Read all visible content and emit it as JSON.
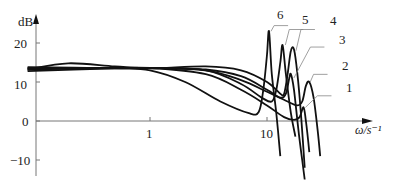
{
  "chart_data": {
    "type": "line",
    "title": "",
    "xlabel": "ω/s⁻¹",
    "ylabel": "dB",
    "xscale": "log",
    "xlim": [
      0.09,
      50
    ],
    "ylim": [
      -14,
      26
    ],
    "x_ticks": [
      {
        "value": 1,
        "label": "1"
      },
      {
        "value": 10,
        "label": "10"
      }
    ],
    "y_ticks": [
      {
        "value": 20,
        "label": "20"
      },
      {
        "value": 10,
        "label": "10"
      },
      {
        "value": 0,
        "label": "0"
      },
      {
        "value": -10,
        "label": "−10"
      }
    ],
    "grid": false,
    "legend": "curve numbers annotated with leader lines",
    "series": [
      {
        "name": "1",
        "points": [
          [
            0.09,
            12.8
          ],
          [
            0.5,
            13.5
          ],
          [
            1,
            13.6
          ],
          [
            3,
            12
          ],
          [
            6,
            8
          ],
          [
            10,
            4
          ],
          [
            14,
            1
          ],
          [
            17,
            0.3
          ],
          [
            19,
            1
          ],
          [
            20.5,
            3.5
          ],
          [
            21.5,
            0
          ],
          [
            23,
            -8
          ]
        ]
      },
      {
        "name": "2",
        "points": [
          [
            0.09,
            13.2
          ],
          [
            0.5,
            13.6
          ],
          [
            1,
            13.6
          ],
          [
            3,
            13
          ],
          [
            6,
            10.5
          ],
          [
            10,
            7.5
          ],
          [
            15,
            5
          ],
          [
            18,
            4
          ],
          [
            20,
            5
          ],
          [
            21.5,
            9
          ],
          [
            23,
            10
          ],
          [
            25,
            6
          ],
          [
            27,
            -2
          ],
          [
            28.5,
            -9
          ]
        ]
      },
      {
        "name": "3",
        "points": [
          [
            0.09,
            13.4
          ],
          [
            0.5,
            13.6
          ],
          [
            1,
            13.6
          ],
          [
            3,
            13.2
          ],
          [
            6,
            11.5
          ],
          [
            10,
            8
          ],
          [
            13,
            6
          ],
          [
            14.5,
            7
          ],
          [
            15.5,
            11
          ],
          [
            16,
            12
          ],
          [
            17,
            8
          ],
          [
            18.5,
            -2
          ],
          [
            20,
            -10
          ],
          [
            21,
            -15
          ]
        ]
      },
      {
        "name": "4",
        "points": [
          [
            0.09,
            13.2
          ],
          [
            0.2,
            14.8
          ],
          [
            0.5,
            14
          ],
          [
            1,
            13.5
          ],
          [
            3,
            14
          ],
          [
            6,
            13
          ],
          [
            10,
            10
          ],
          [
            13,
            7
          ],
          [
            14,
            7
          ],
          [
            15,
            12
          ],
          [
            16,
            18
          ],
          [
            17,
            18.3
          ],
          [
            18.2,
            12
          ],
          [
            19.5,
            2
          ],
          [
            21,
            -12
          ]
        ]
      },
      {
        "name": "5",
        "points": [
          [
            0.09,
            13.6
          ],
          [
            0.5,
            13.6
          ],
          [
            1,
            13.6
          ],
          [
            3,
            13
          ],
          [
            6,
            9.5
          ],
          [
            9,
            6
          ],
          [
            11,
            5
          ],
          [
            12,
            8
          ],
          [
            13,
            15
          ],
          [
            13.6,
            19.5
          ],
          [
            14.5,
            12
          ],
          [
            16,
            2
          ],
          [
            17.5,
            -4
          ]
        ]
      },
      {
        "name": "6",
        "points": [
          [
            0.09,
            13.8
          ],
          [
            0.5,
            13.5
          ],
          [
            1,
            13
          ],
          [
            2,
            10
          ],
          [
            4,
            5
          ],
          [
            7,
            2
          ],
          [
            8.5,
            2.3
          ],
          [
            9.3,
            8
          ],
          [
            10,
            17
          ],
          [
            10.4,
            23
          ],
          [
            11,
            12
          ],
          [
            12,
            2
          ],
          [
            13,
            -9
          ]
        ]
      }
    ],
    "annotations": [
      {
        "text": "6",
        "at": [
          11.5,
          26
        ],
        "peak": [
          10.4,
          23
        ]
      },
      {
        "text": "5",
        "at": [
          15.5,
          25
        ],
        "peak": [
          13.8,
          19.5
        ]
      },
      {
        "text": "4",
        "at": [
          19.5,
          25
        ],
        "peak": [
          17,
          18
        ]
      },
      {
        "text": "3",
        "at": [
          23.5,
          20.5
        ],
        "peak": [
          16.3,
          11
        ]
      },
      {
        "text": "2",
        "at": [
          25,
          13.5
        ],
        "peak": [
          22.5,
          10
        ]
      },
      {
        "text": "1",
        "at": [
          27,
          8
        ],
        "peak": [
          20.5,
          3.5
        ]
      }
    ]
  }
}
